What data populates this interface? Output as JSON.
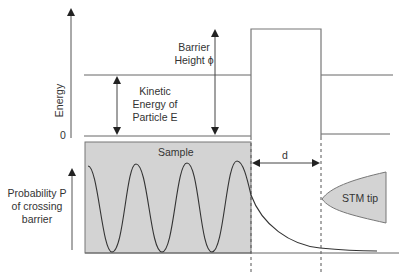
{
  "diagram": {
    "energy_axis_label": "Energy",
    "zero_label": "0",
    "barrier_label_line1": "Barrier",
    "barrier_label_line2": "Height ϕ",
    "kinetic_label_line1": "Kinetic",
    "kinetic_label_line2": "Energy of",
    "kinetic_label_line3": "Particle E",
    "sample_label": "Sample",
    "distance_label": "d",
    "tip_label": "STM tip",
    "probability_label_line1": "Probability P",
    "probability_label_line2": "of crossing",
    "probability_label_line3": "barrier"
  },
  "colors": {
    "line": "#555555",
    "fill": "#d3d3d3",
    "text": "#333333"
  }
}
